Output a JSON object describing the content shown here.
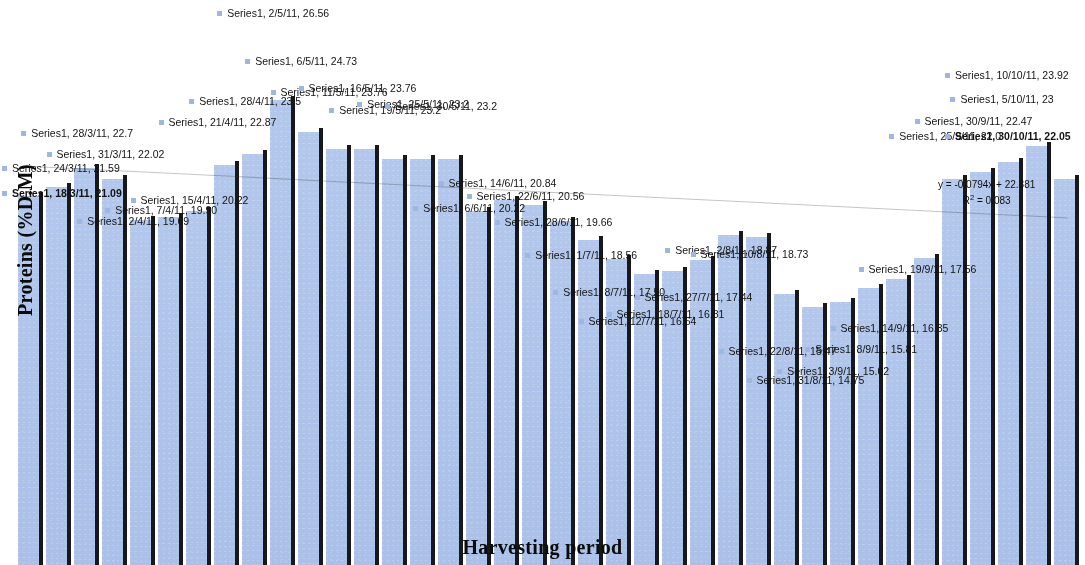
{
  "chart_data": {
    "type": "bar",
    "title": "",
    "xlabel": "Harvesting period",
    "ylabel": "Proteins (%D.M)",
    "series_name": "Series1",
    "ylim": [
      0,
      28
    ],
    "grid": false,
    "legend": "none",
    "label_format": "Series1, {date}, {value}",
    "categories": [
      "18/3/11",
      "24/3/11",
      "28/3/11",
      "31/3/11",
      "2/4/11",
      "7/4/11",
      "15/4/11",
      "21/4/11",
      "28/4/11",
      "2/5/11",
      "6/5/11",
      "11/5/11",
      "16/5/11",
      "19/5/11",
      "25/5/11",
      "30/5/11",
      "6/6/11",
      "14/6/11",
      "22/6/11",
      "28/6/11",
      "1/7/11",
      "8/7/11",
      "12/7/11",
      "18/7/11",
      "27/7/11",
      "2/8/11",
      "10/8/11",
      "22/8/11",
      "31/8/11",
      "3/9/11",
      "8/9/11",
      "14/9/11",
      "19/9/11",
      "25/9/11",
      "30/9/11",
      "5/10/11",
      "10/10/11",
      "30/10/11"
    ],
    "values": [
      21.09,
      21.59,
      22.7,
      22.02,
      19.69,
      19.9,
      20.22,
      22.87,
      23.5,
      26.56,
      24.73,
      23.76,
      23.76,
      23.2,
      23.2,
      23.2,
      20.22,
      20.84,
      20.56,
      19.66,
      18.56,
      17.5,
      16.64,
      16.81,
      17.44,
      18.87,
      18.73,
      15.47,
      14.75,
      15.02,
      15.81,
      16.35,
      17.56,
      22.02,
      22.47,
      23.0,
      23.92,
      22.05
    ],
    "labels": [
      {
        "date": "18/3/11",
        "value": "21.09",
        "text": "Series1, 18/3/11, 21.09",
        "bold": true
      },
      {
        "date": "24/3/11",
        "value": "21.59",
        "text": "Series1, 24/3/11, 21.59",
        "bold": false
      },
      {
        "date": "28/3/11",
        "value": "22.7",
        "text": "Series1, 28/3/11, 22.7",
        "bold": false
      },
      {
        "date": "31/3/11",
        "value": "22.02",
        "text": "Series1, 31/3/11, 22.02",
        "bold": false
      },
      {
        "date": "2/4/11",
        "value": "19.69",
        "text": "Series1, 2/4/11, 19.69",
        "bold": false
      },
      {
        "date": "7/4/11",
        "value": "19.90",
        "text": "Series1, 7/4/11, 19.90",
        "bold": false
      },
      {
        "date": "15/4/11",
        "value": "20.22",
        "text": "Series1, 15/4/11, 20.22",
        "bold": false
      },
      {
        "date": "21/4/11",
        "value": "22.87",
        "text": "Series1, 21/4/11, 22.87",
        "bold": false
      },
      {
        "date": "28/4/11",
        "value": "23.5",
        "text": "Series1, 28/4/11, 23.5",
        "bold": false
      },
      {
        "date": "2/5/11",
        "value": "26.56",
        "text": "Series1, 2/5/11, 26.56",
        "bold": false
      },
      {
        "date": "6/5/11",
        "value": "24.73",
        "text": "Series1, 6/5/11, 24.73",
        "bold": false
      },
      {
        "date": "11/5/11",
        "value": "23.76",
        "text": "Series1, 11/5/11, 23.76",
        "bold": false
      },
      {
        "date": "16/5/11",
        "value": "23.76",
        "text": "Series1, 16/5/11, 23.76",
        "bold": false
      },
      {
        "date": "19/5/11",
        "value": "23.2",
        "text": "Series1, 19/5/11, 23.2",
        "bold": false
      },
      {
        "date": "25/5/11",
        "value": "23.2",
        "text": "Series1, 25/5/11, 23.2",
        "bold": false
      },
      {
        "date": "30/5/11",
        "value": "23.2",
        "text": "Series1, 30/5/11, 23.2",
        "bold": false
      },
      {
        "date": "6/6/11",
        "value": "20.22",
        "text": "Series1, 6/6/11, 20.22",
        "bold": false
      },
      {
        "date": "14/6/11",
        "value": "20.84",
        "text": "Series1, 14/6/11, 20.84",
        "bold": false
      },
      {
        "date": "22/6/11",
        "value": "20.56",
        "text": "Series1, 22/6/11, 20.56",
        "bold": false
      },
      {
        "date": "28/6/11",
        "value": "19.66",
        "text": "Series1, 28/6/11, 19.66",
        "bold": false
      },
      {
        "date": "1/7/11",
        "value": "18.56",
        "text": "Series1, 1/7/11, 18.56",
        "bold": false
      },
      {
        "date": "8/7/11",
        "value": "17.50",
        "text": "Series1, 8/7/11, 17.50",
        "bold": false
      },
      {
        "date": "12/7/11",
        "value": "16.64",
        "text": "Series1, 12/7/11, 16.64",
        "bold": false
      },
      {
        "date": "18/7/11",
        "value": "16.81",
        "text": "Series1, 18/7/11, 16.81",
        "bold": false
      },
      {
        "date": "27/7/11",
        "value": "17.44",
        "text": "Series1, 27/7/11, 17.44",
        "bold": false
      },
      {
        "date": "2/8/11",
        "value": "18.87",
        "text": "Series1, 2/8/11, 18.87",
        "bold": false
      },
      {
        "date": "10/8/11",
        "value": "18.73",
        "text": "Series1, 10/8/11, 18.73",
        "bold": false
      },
      {
        "date": "22/8/11",
        "value": "15.47",
        "text": "Series1, 22/8/11, 15.47",
        "bold": false
      },
      {
        "date": "31/8/11",
        "value": "14.75",
        "text": "Series1, 31/8/11, 14.75",
        "bold": false
      },
      {
        "date": "3/9/11",
        "value": "15.02",
        "text": "Series1, 3/9/11, 15.02",
        "bold": false
      },
      {
        "date": "8/9/11",
        "value": "15.81",
        "text": "Series1, 8/9/11, 15.81",
        "bold": false
      },
      {
        "date": "14/9/11",
        "value": "16.35",
        "text": "Series1, 14/9/11, 16.35",
        "bold": false
      },
      {
        "date": "19/9/11",
        "value": "17.56",
        "text": "Series1, 19/9/11, 17.56",
        "bold": false
      },
      {
        "date": "25/9/11",
        "value": "22.02",
        "text": "Series1, 25/9/11, 22.0",
        "bold": false
      },
      {
        "date": "30/9/11",
        "value": "22.47",
        "text": "Series1, 30/9/11, 22.47",
        "bold": false
      },
      {
        "date": "5/10/11",
        "value": "23",
        "text": "Series1, 5/10/11, 23",
        "bold": false
      },
      {
        "date": "10/10/11",
        "value": "23.92",
        "text": "Series1, 10/10/11, 23.92",
        "bold": false
      },
      {
        "date": "30/10/11",
        "value": "22.05",
        "text": "Series1, 30/10/11, 22.05",
        "bold": true
      }
    ],
    "trendline": {
      "equation": "y = -0.0794x + 22.881",
      "r_squared_label": "R",
      "r_squared_sup": "2",
      "r_squared_value": " = 0.083",
      "slope": -0.0794,
      "intercept": 22.881,
      "r2": 0.083
    },
    "colors": {
      "bar_fill": "#adc2e8",
      "error_bar": "#1a1a1a",
      "label_text": "#141414",
      "axis_title": "#0d0d0d",
      "marker": "#9db6e0",
      "background": "#ffffff"
    }
  }
}
